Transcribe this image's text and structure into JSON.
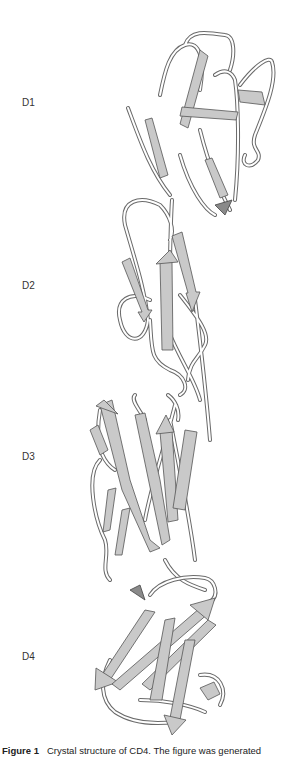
{
  "figure": {
    "title": "Crystal structure of CD4",
    "domain_labels": [
      "D1",
      "D2",
      "D3",
      "D4"
    ],
    "colors": {
      "strand_fill": "#c9c9c9",
      "strand_edge": "#555555",
      "coil_outline": "#6a6a6a",
      "background": "#ffffff"
    }
  },
  "caption": {
    "label": "Figure 1",
    "text": "Crystal structure of CD4. The figure was generated"
  }
}
